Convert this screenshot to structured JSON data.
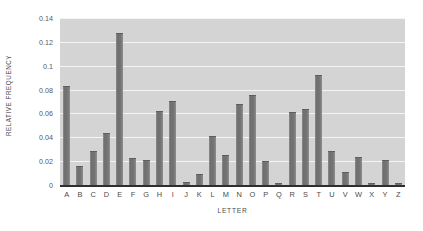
{
  "chart_data": {
    "type": "bar",
    "title": "",
    "xlabel": "LETTER",
    "ylabel": "RELATIVE FREQUENCY",
    "categories": [
      "A",
      "B",
      "C",
      "D",
      "E",
      "F",
      "G",
      "H",
      "I",
      "J",
      "K",
      "L",
      "M",
      "N",
      "O",
      "P",
      "Q",
      "R",
      "S",
      "T",
      "U",
      "V",
      "W",
      "X",
      "Y",
      "Z"
    ],
    "values": [
      0.082,
      0.015,
      0.028,
      0.043,
      0.127,
      0.022,
      0.02,
      0.061,
      0.07,
      0.002,
      0.008,
      0.04,
      0.024,
      0.067,
      0.075,
      0.019,
      0.001,
      0.06,
      0.063,
      0.091,
      0.028,
      0.01,
      0.023,
      0.001,
      0.02,
      0.001
    ],
    "ylim": [
      0,
      0.14
    ],
    "yticks": [
      0,
      0.02,
      0.04,
      0.06,
      0.08,
      0.1,
      0.12,
      0.14
    ],
    "ytick_labels": [
      "0",
      "0.02",
      "0.04",
      "0.06",
      "0.08",
      "0.1",
      "0.12",
      "0.14"
    ],
    "grid": true,
    "grid_color": "#f4f4f4",
    "plot_background": "#d4d4d4",
    "bar_color": "#757575",
    "axis_color": "#2e2e2e",
    "legend": null
  }
}
